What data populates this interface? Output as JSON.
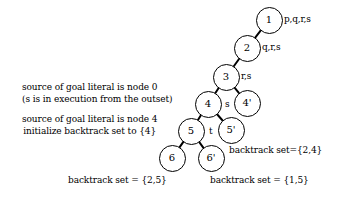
{
  "diagram": {
    "stroke_color": "#000000",
    "background_color": "#ffffff",
    "nodes": [
      {
        "id": "n1",
        "label": "1",
        "cx": 269,
        "cy": 20,
        "r": 13.5
      },
      {
        "id": "n2",
        "label": "2",
        "cx": 247,
        "cy": 48,
        "r": 13.5
      },
      {
        "id": "n3",
        "label": "3",
        "cx": 226,
        "cy": 77,
        "r": 13.5
      },
      {
        "id": "n4",
        "label": "4",
        "cx": 208,
        "cy": 104,
        "r": 13.5
      },
      {
        "id": "n4p",
        "label": "4'",
        "cx": 247,
        "cy": 103,
        "r": 13.5
      },
      {
        "id": "n5",
        "label": "5",
        "cx": 191,
        "cy": 131,
        "r": 13.5
      },
      {
        "id": "n5p",
        "label": "5'",
        "cx": 231,
        "cy": 130,
        "r": 13.5
      },
      {
        "id": "n6",
        "label": "6",
        "cx": 172,
        "cy": 158,
        "r": 13.5
      },
      {
        "id": "n6p",
        "label": "6'",
        "cx": 211,
        "cy": 158,
        "r": 13.5
      }
    ],
    "edges": [
      {
        "from": "n1",
        "to": "n2"
      },
      {
        "from": "n2",
        "to": "n3"
      },
      {
        "from": "n3",
        "to": "n4"
      },
      {
        "from": "n3",
        "to": "n4p"
      },
      {
        "from": "n4",
        "to": "n5"
      },
      {
        "from": "n4",
        "to": "n5p"
      },
      {
        "from": "n5",
        "to": "n6"
      },
      {
        "from": "n5",
        "to": "n6p"
      }
    ],
    "literal_labels": [
      {
        "id": "lit1",
        "text": "p,q,r,s",
        "x": 284,
        "y": 14
      },
      {
        "id": "lit2",
        "text": "q,r,s",
        "x": 262,
        "y": 42
      },
      {
        "id": "lit3",
        "text": "r,s",
        "x": 241,
        "y": 71
      }
    ],
    "edge_labels": [
      {
        "id": "edge-label-s",
        "text": "s",
        "x": 225,
        "y": 99
      },
      {
        "id": "edge-label-t",
        "text": "t",
        "x": 209,
        "y": 126
      }
    ],
    "annotations": [
      {
        "id": "source-node-0",
        "lines": [
          "source of goal literal is node 0",
          "(s is in execution from the outset)"
        ],
        "x": 22,
        "y": 82,
        "align": "left"
      },
      {
        "id": "source-node-4",
        "lines": [
          "source of goal literal is node 4",
          "initialize backtrack set to {4}"
        ],
        "x": 22,
        "y": 114,
        "align": "center"
      },
      {
        "id": "backtrack-set-2-4",
        "lines": [
          "backtrack set={2,4}"
        ],
        "x": 229,
        "y": 145,
        "align": "left"
      },
      {
        "id": "backtrack-set-2-5",
        "lines": [
          "backtrack set = {2,5}"
        ],
        "x": 68,
        "y": 175,
        "align": "left"
      },
      {
        "id": "backtrack-set-1-5",
        "lines": [
          "backtrack set = {1,5}"
        ],
        "x": 210,
        "y": 175,
        "align": "left"
      }
    ]
  }
}
